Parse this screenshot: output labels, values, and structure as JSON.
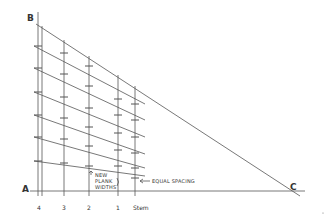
{
  "diagram": {
    "points": {
      "A": "A",
      "B": "B",
      "C": "C"
    },
    "column_labels": [
      "4",
      "3",
      "2",
      "1",
      "Stem"
    ],
    "annotations": {
      "new_plank_widths": [
        "NEW",
        "PLANK",
        "WIDTHS"
      ],
      "equal_spacing": "EQUAL SPACING"
    },
    "colors": {
      "line": "#555555",
      "text": "#333333",
      "background": "#ffffff"
    }
  }
}
